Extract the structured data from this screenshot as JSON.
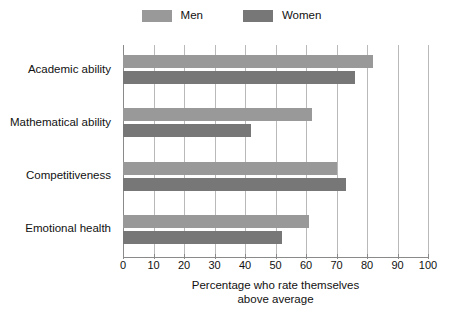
{
  "chart_data": {
    "type": "bar",
    "orientation": "horizontal",
    "title": "",
    "xlabel": "Percentage who rate themselves above average",
    "xlabel_lines": [
      "Percentage who rate themselves",
      "above average"
    ],
    "ylabel": "",
    "categories": [
      "Academic ability",
      "Mathematical ability",
      "Competitiveness",
      "Emotional health"
    ],
    "series": [
      {
        "name": "Men",
        "color": "#999999",
        "values": [
          82,
          62,
          70,
          61
        ]
      },
      {
        "name": "Women",
        "color": "#777777",
        "values": [
          76,
          42,
          73,
          52
        ]
      }
    ],
    "xlim": [
      0,
      100
    ],
    "xticks": [
      0,
      10,
      20,
      30,
      40,
      50,
      60,
      70,
      80,
      90,
      100
    ],
    "xtick_labels": [
      "0",
      "10",
      "20",
      "30",
      "40",
      "50",
      "60",
      "70",
      "80",
      "90",
      "100"
    ],
    "grid": "vertical",
    "legend_position": "top-center",
    "legend_entries": [
      "Men",
      "Women"
    ]
  },
  "style": {
    "men_color": "#999999",
    "women_color": "#777777",
    "grid_color": "#b9b9b9",
    "axis_color": "#8a8a8a",
    "text_color": "#111111",
    "background": "#ffffff"
  }
}
